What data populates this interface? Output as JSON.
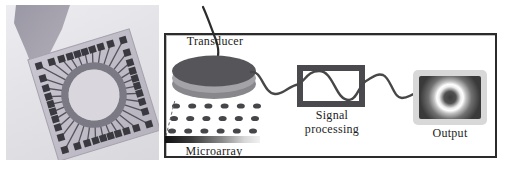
{
  "figure": {
    "left_panel": {
      "photo_alt": "microelectrode-array-chip-photo",
      "electrode_pads": 36
    },
    "diagram": {
      "labels": {
        "transducer": "Transducer",
        "signal_line1": "Signal",
        "signal_line2": "processing",
        "output": "Output",
        "microarray": "Microarray"
      },
      "microarray_dots": {
        "rows": 3,
        "cols": 6
      },
      "colors": {
        "box_border": "#2b2b2b",
        "signal_box": "#4a4a4e",
        "wire": "#474747",
        "disc_top": "#55555a",
        "disc_band": "#a4a4a8",
        "disc_base": "#88888c",
        "dot": "#46464a",
        "chip_substrate": "#c2bfca",
        "chip_ring": "#7b7983",
        "chip_inner": "#d9d7dd",
        "chip_pad": "#3b3940",
        "chip_trace": "#55525a",
        "probe": "#a7a4af"
      }
    }
  }
}
